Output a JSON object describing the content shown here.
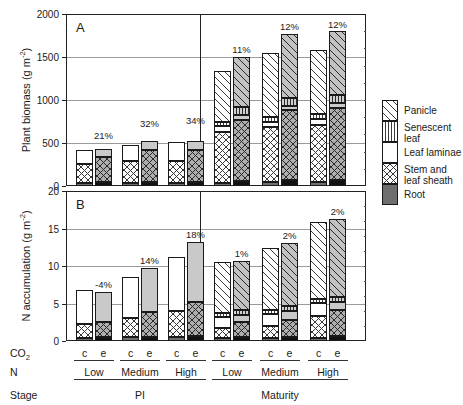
{
  "figure": {
    "panels": [
      {
        "letter": "A",
        "ylabel_main": "Plant biomass (g m",
        "ylabel_sup": "-2",
        "ylabel_tail": ")",
        "yticks": [
          "0",
          "500",
          "1000",
          "1500",
          "2000"
        ],
        "ymin": 0,
        "ymax": 2000
      },
      {
        "letter": "B",
        "ylabel_main": "N accumulation (g m",
        "ylabel_sup": "-2",
        "ylabel_tail": ")",
        "yticks": [
          "0",
          "5",
          "10",
          "15",
          "20"
        ],
        "ymin": 0,
        "ymax": 20
      }
    ],
    "axis_rows": [
      {
        "name": "CO2",
        "label_main": "CO",
        "label_sub": "2"
      },
      {
        "name": "N",
        "label_main": "N",
        "label_sub": ""
      },
      {
        "name": "Stage",
        "label_main": "Stage",
        "label_sub": ""
      }
    ],
    "co2_levels": [
      "c",
      "e",
      "c",
      "e",
      "c",
      "e",
      "c",
      "e",
      "c",
      "e",
      "c",
      "e"
    ],
    "n_levels": [
      "Low",
      "Medium",
      "High",
      "Low",
      "Medium",
      "High"
    ],
    "stages": [
      "PI",
      "Maturity"
    ]
  },
  "legend": {
    "items": [
      {
        "key": "panicle",
        "label_l1": "Panicle",
        "label_l2": ""
      },
      {
        "key": "senescent",
        "label_l1": "Senescent",
        "label_l2": "leaf"
      },
      {
        "key": "laminae",
        "label_l1": "Leaf laminae",
        "label_l2": ""
      },
      {
        "key": "stem",
        "label_l1": "Stem and",
        "label_l2": "leaf sheath"
      },
      {
        "key": "root",
        "label_l1": "Root",
        "label_l2": ""
      }
    ]
  },
  "chart_data": [
    {
      "id": "panel-A",
      "type": "bar",
      "subtype": "stacked",
      "title": "A",
      "xlabel": "",
      "ylabel": "Plant biomass (g m-2)",
      "ylim": [
        0,
        2000
      ],
      "yticks": [
        0,
        500,
        1000,
        1500,
        2000
      ],
      "grid": "horizontal",
      "legend_position": "right-outside",
      "categories": [
        "PI/Low/c",
        "PI/Low/e",
        "PI/Medium/c",
        "PI/Medium/e",
        "PI/High/c",
        "PI/High/e",
        "Maturity/Low/c",
        "Maturity/Low/e",
        "Maturity/Medium/c",
        "Maturity/Medium/e",
        "Maturity/High/c",
        "Maturity/High/e"
      ],
      "series": [
        {
          "name": "Root",
          "values": [
            30,
            42,
            32,
            45,
            33,
            48,
            38,
            62,
            42,
            68,
            45,
            72
          ]
        },
        {
          "name": "Stem and leaf sheath",
          "values": [
            225,
            295,
            255,
            370,
            260,
            370,
            595,
            710,
            645,
            810,
            665,
            840
          ]
        },
        {
          "name": "Leaf laminae",
          "values": [
            160,
            90,
            195,
            110,
            215,
            110,
            60,
            55,
            60,
            55,
            65,
            55
          ]
        },
        {
          "name": "Senescent leaf",
          "values": [
            0,
            0,
            0,
            0,
            0,
            0,
            55,
            95,
            60,
            95,
            65,
            95
          ]
        },
        {
          "name": "Panicle",
          "values": [
            0,
            0,
            0,
            0,
            0,
            0,
            590,
            580,
            735,
            745,
            740,
            735
          ]
        }
      ],
      "totals": [
        415,
        500,
        485,
        640,
        510,
        680,
        1340,
        1500,
        1540,
        1770,
        1580,
        1795
      ],
      "annotations": [
        {
          "category": "PI/Low/e",
          "text": "21%"
        },
        {
          "category": "PI/Medium/e",
          "text": "32%"
        },
        {
          "category": "PI/High/e",
          "text": "34%"
        },
        {
          "category": "Maturity/Low/e",
          "text": "11%"
        },
        {
          "category": "Maturity/Medium/e",
          "text": "12%"
        },
        {
          "category": "Maturity/High/e",
          "text": "12%"
        }
      ]
    },
    {
      "id": "panel-B",
      "type": "bar",
      "subtype": "stacked",
      "title": "B",
      "xlabel": "",
      "ylabel": "N accumulation (g m-2)",
      "ylim": [
        0,
        20
      ],
      "yticks": [
        0,
        5,
        10,
        15,
        20
      ],
      "grid": "horizontal",
      "legend_position": "right-outside",
      "categories": [
        "PI/Low/c",
        "PI/Low/e",
        "PI/Medium/c",
        "PI/Medium/e",
        "PI/High/c",
        "PI/High/e",
        "Maturity/Low/c",
        "Maturity/Low/e",
        "Maturity/Medium/c",
        "Maturity/Medium/e",
        "Maturity/High/c",
        "Maturity/High/e"
      ],
      "series": [
        {
          "name": "Root",
          "values": [
            0.45,
            0.55,
            0.48,
            0.6,
            0.5,
            0.7,
            0.35,
            0.55,
            0.38,
            0.6,
            0.4,
            0.65
          ]
        },
        {
          "name": "Stem and leaf sheath",
          "values": [
            1.85,
            2.0,
            2.55,
            3.25,
            3.45,
            4.55,
            1.45,
            1.95,
            1.65,
            2.25,
            2.95,
            3.45
          ]
        },
        {
          "name": "Leaf laminae",
          "values": [
            4.5,
            4.05,
            5.55,
            5.9,
            7.2,
            8.0,
            1.45,
            1.0,
            1.55,
            1.1,
            1.75,
            1.05
          ]
        },
        {
          "name": "Senescent leaf",
          "values": [
            0,
            0,
            0,
            0,
            0,
            0,
            0.45,
            0.7,
            0.5,
            0.75,
            0.55,
            0.75
          ]
        },
        {
          "name": "Panicle",
          "values": [
            0,
            0,
            0,
            0,
            0,
            0,
            6.8,
            6.45,
            8.35,
            8.35,
            10.25,
            10.4
          ]
        }
      ],
      "totals": [
        6.8,
        6.6,
        8.6,
        9.75,
        11.15,
        13.25,
        10.5,
        10.65,
        12.43,
        13.05,
        15.9,
        16.3
      ],
      "annotations": [
        {
          "category": "PI/Low/e",
          "text": "-4%"
        },
        {
          "category": "PI/Medium/e",
          "text": "14%"
        },
        {
          "category": "PI/High/e",
          "text": "18%"
        },
        {
          "category": "Maturity/Low/e",
          "text": "1%"
        },
        {
          "category": "Maturity/Medium/e",
          "text": "2%"
        },
        {
          "category": "Maturity/High/e",
          "text": "2%"
        }
      ]
    }
  ],
  "colors": {
    "root_c": "#6e6e6e",
    "root_e": "#121212",
    "stem_fill_e": "#aeaeae",
    "laminae_e": "#c9c9c9",
    "senescent_e": "#cfcfcf",
    "panicle_e": "#c2c2c2",
    "outline": "#1a1a1a",
    "gridline": "#9a9a9a"
  }
}
